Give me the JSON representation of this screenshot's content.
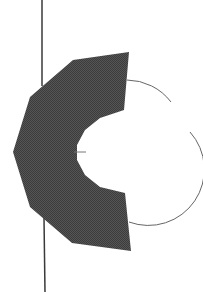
{
  "diagram": {
    "background": "#ffffff",
    "axis_line": {
      "color": "#3a3a3a",
      "top_segment": {
        "x1": 42,
        "y1": 0,
        "x2": 42,
        "y2": 86
      },
      "bottom_segment": {
        "x1": 44,
        "y1": 218,
        "x2": 45,
        "y2": 292
      }
    },
    "shape": {
      "fill": "#4a4a4a",
      "points": "129,52 73,60 30,97 13,152 30,207 72,243 131,251 125,193 100,187 85,175 77,160 77,145 85,130 100,118 124,110"
    },
    "circle": {
      "stroke": "#666666",
      "arc_top": "M 127,80 A 56 56 0 0 1 171,102",
      "arc_right": "M 190,132 A 56 56 0 0 1 129,222",
      "center_tick": {
        "x1": 74,
        "y1": 152,
        "x2": 86,
        "y2": 152
      }
    }
  }
}
